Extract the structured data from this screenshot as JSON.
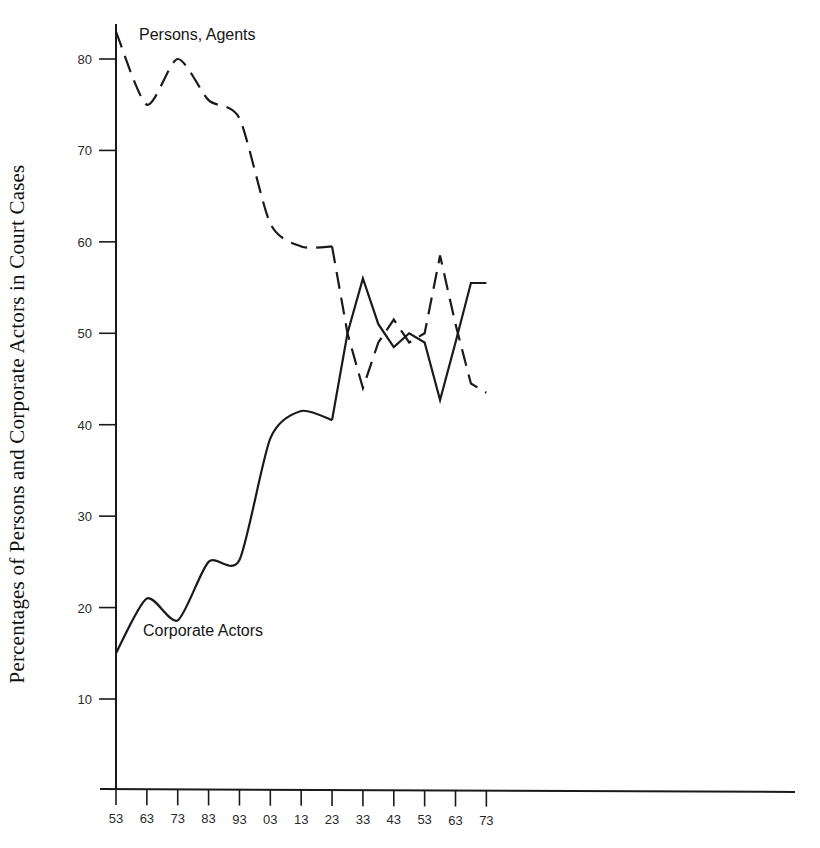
{
  "figure": {
    "background": "#ffffff",
    "ink_color": "#1a1a1a"
  },
  "axis": {
    "y_title": "Percentages of Persons and Corporate Actors in Court Cases",
    "x_title": ""
  },
  "labels": {
    "persons": "Persons, Agents",
    "corporate": "Corporate Actors"
  },
  "chart_data": {
    "type": "line",
    "title": "",
    "subtitle": "",
    "xlabel": "",
    "ylabel": "Percentages of Persons and Corporate Actors in Court Cases",
    "xlim": [
      1753,
      1973
    ],
    "ylim": [
      0,
      88
    ],
    "y_ticks": [
      10,
      20,
      30,
      40,
      50,
      60,
      70,
      80
    ],
    "y_tick_labels": [
      "10",
      "20",
      "30",
      "40",
      "50",
      "60",
      "70",
      "80"
    ],
    "x_ticks": [
      1753,
      1763,
      1773,
      1783,
      1793,
      1803,
      1813,
      1823,
      1833,
      1843,
      1853,
      1863,
      1873
    ],
    "x_tick_labels": [
      "53",
      "63",
      "73",
      "83",
      "93",
      "03",
      "13",
      "23",
      "33",
      "43",
      "53",
      "63",
      "73"
    ],
    "grid": false,
    "legend_position": "inline-annotation",
    "annotations": [
      {
        "text": "Persons, Agents",
        "x": 1766,
        "y": 84
      },
      {
        "text": "Corporate Actors",
        "x": 1767,
        "y": 14
      }
    ],
    "series": [
      {
        "name": "Persons, Agents",
        "style": "dashed",
        "color": "#1a1a1a",
        "x": [
          1753,
          1763,
          1773,
          1783,
          1793,
          1803,
          1813,
          1823,
          1828,
          1833,
          1838,
          1843,
          1848,
          1853,
          1858,
          1863,
          1868,
          1873
        ],
        "values": [
          83.0,
          75.0,
          80.0,
          75.5,
          73.5,
          62.0,
          59.5,
          59.5,
          50.0,
          44.0,
          49.0,
          51.5,
          49.0,
          50.0,
          58.5,
          51.0,
          44.5,
          43.5
        ]
      },
      {
        "name": "Corporate Actors",
        "style": "solid",
        "color": "#1a1a1a",
        "x": [
          1753,
          1763,
          1773,
          1783,
          1793,
          1803,
          1813,
          1823,
          1828,
          1833,
          1838,
          1843,
          1848,
          1853,
          1858,
          1863,
          1868,
          1873
        ],
        "values": [
          15.0,
          21.0,
          18.6,
          25.0,
          25.2,
          38.5,
          41.5,
          40.5,
          50.0,
          56.0,
          51.0,
          48.5,
          50.0,
          49.0,
          42.7,
          49.0,
          55.5,
          55.5
        ]
      }
    ]
  }
}
